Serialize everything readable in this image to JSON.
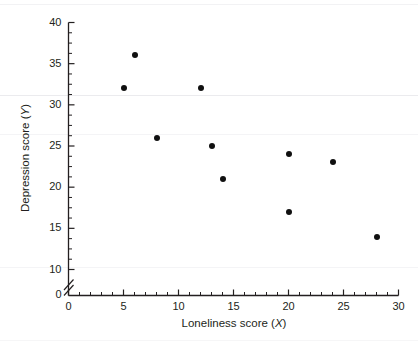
{
  "chart_data": {
    "type": "scatter",
    "title": "",
    "xlabel": "Loneliness score (X)",
    "ylabel": "Depression score (Y)",
    "xlim": [
      0,
      30
    ],
    "ylim": [
      0,
      40
    ],
    "y_axis_break": true,
    "y_break_between": [
      0,
      10
    ],
    "grid": false,
    "legend": null,
    "x_ticks": [
      0,
      5,
      10,
      15,
      20,
      25,
      30
    ],
    "x_tick_labels": [
      "0",
      "5",
      "10",
      "15",
      "20",
      "25",
      "30"
    ],
    "x_minor_tick_step": 1,
    "y_ticks": [
      10,
      15,
      20,
      25,
      30,
      35,
      40
    ],
    "y_tick_labels": [
      "10",
      "15",
      "20",
      "25",
      "30",
      "35",
      "40"
    ],
    "y_origin_label": "0",
    "y_minor_tick_step": 1.25,
    "marker": "filled-circle",
    "marker_color": "#101010",
    "axis_color": "#231f20",
    "points": [
      {
        "x": 5,
        "y": 32
      },
      {
        "x": 6,
        "y": 36
      },
      {
        "x": 8,
        "y": 26
      },
      {
        "x": 12,
        "y": 32
      },
      {
        "x": 13,
        "y": 25
      },
      {
        "x": 14,
        "y": 21
      },
      {
        "x": 20,
        "y": 24
      },
      {
        "x": 20,
        "y": 17
      },
      {
        "x": 24,
        "y": 23
      },
      {
        "x": 28,
        "y": 14
      }
    ]
  },
  "axes": {
    "x_label_text": "Loneliness score (",
    "x_label_var": "X",
    "x_label_close": ")",
    "y_label_text": "Depression score (",
    "y_label_var": "Y",
    "y_label_close": ")"
  }
}
